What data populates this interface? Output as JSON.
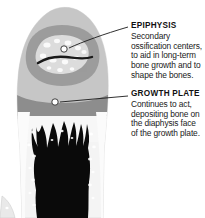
{
  "figure": {
    "background_color": "#ffffff"
  },
  "illustration": {
    "name": "long-bone-cross-section",
    "regions": [
      {
        "id": "epiphysis-head",
        "label": "epiphysis",
        "tone": "#c9c9c9"
      },
      {
        "id": "spongy-bone-band",
        "label": "secondary ossification",
        "tone": "#9a9a9a"
      },
      {
        "id": "growth-plate-band",
        "label": "growth plate",
        "tone": "#8f8f8f"
      },
      {
        "id": "cortical-wall",
        "label": "cortical bone",
        "tone": "#f2f2f2"
      },
      {
        "id": "marrow-cavity",
        "label": "marrow cavity",
        "tone": "#0b0b0b"
      }
    ]
  },
  "callouts": [
    {
      "id": "epiphysis",
      "heading": "EPIPHYSIS",
      "body_lines": [
        "Secondary",
        "ossification centers,",
        "to aid in long-term",
        "bone growth and to",
        "shape the bones."
      ],
      "marker": {
        "x": 64,
        "y": 49
      },
      "leader_style": "curved"
    },
    {
      "id": "growth-plate",
      "heading": "GROWTH PLATE",
      "body_lines": [
        "Continues to act,",
        "depositing bone on",
        "the diaphysis face",
        "of the growth plate."
      ],
      "marker": {
        "x": 55,
        "y": 102
      },
      "leader_style": "straight"
    }
  ],
  "colors": {
    "text": "#111111",
    "leader_line": "#1a1a1a",
    "marker_fill": "#ffffff",
    "marker_stroke": "#2b2b2b"
  }
}
